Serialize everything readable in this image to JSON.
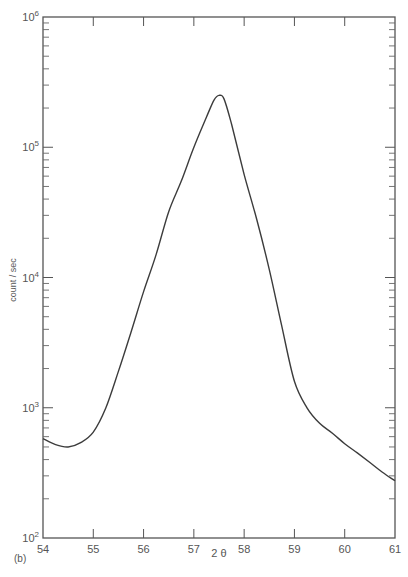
{
  "chart_data": {
    "type": "line",
    "title": "",
    "panel_label": "(b)",
    "xlabel": "2 θ",
    "ylabel": "count / sec",
    "yscale": "log",
    "xlim": [
      54,
      61
    ],
    "ylim": [
      100,
      1000000
    ],
    "x_ticks": [
      54,
      55,
      56,
      57,
      58,
      59,
      60,
      61
    ],
    "y_ticks": [
      {
        "value": 100,
        "base": "10",
        "exp": "2"
      },
      {
        "value": 1000,
        "base": "10",
        "exp": "3"
      },
      {
        "value": 10000,
        "base": "10",
        "exp": "4"
      },
      {
        "value": 100000,
        "base": "10",
        "exp": "5"
      },
      {
        "value": 1000000,
        "base": "10",
        "exp": "6"
      }
    ],
    "grid": false,
    "legend": null,
    "series": [
      {
        "name": "diffraction peak",
        "x": [
          54.0,
          54.25,
          54.5,
          54.75,
          55.0,
          55.25,
          55.5,
          55.75,
          56.0,
          56.25,
          56.5,
          56.75,
          57.0,
          57.25,
          57.4,
          57.5,
          57.6,
          57.75,
          58.0,
          58.25,
          58.5,
          58.75,
          59.0,
          59.25,
          59.5,
          59.75,
          60.0,
          60.25,
          60.5,
          60.75,
          61.0
        ],
        "y": [
          580,
          520,
          500,
          540,
          650,
          1000,
          1900,
          3800,
          7800,
          15000,
          32000,
          55000,
          100000,
          170000,
          230000,
          250000,
          235000,
          150000,
          62000,
          28000,
          11500,
          4200,
          1600,
          1000,
          760,
          640,
          530,
          450,
          380,
          320,
          275
        ]
      }
    ]
  }
}
